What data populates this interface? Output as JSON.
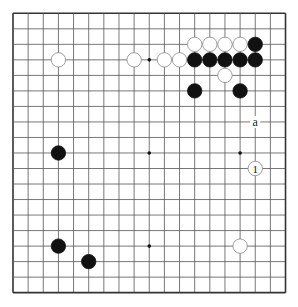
{
  "diagram": {
    "type": "go-board",
    "size": 19,
    "geometry": {
      "left": 13,
      "top": 13.3,
      "dx": 15.14,
      "dy": 15.52,
      "stone_radius": 7.2
    },
    "colors": {
      "line": "#555555",
      "border": "#333333",
      "black_stone": "#111111",
      "white_stone_fill": "#ffffff",
      "white_stone_stroke": "#888888",
      "hoshi": "#111111"
    },
    "hoshi": [
      {
        "col": 3,
        "row": 3
      },
      {
        "col": 9,
        "row": 3
      },
      {
        "col": 15,
        "row": 3
      },
      {
        "col": 3,
        "row": 9
      },
      {
        "col": 9,
        "row": 9
      },
      {
        "col": 15,
        "row": 9
      },
      {
        "col": 3,
        "row": 15
      },
      {
        "col": 9,
        "row": 15
      },
      {
        "col": 15,
        "row": 15
      }
    ],
    "stones": [
      {
        "color": "white",
        "col": 12,
        "row": 2
      },
      {
        "color": "white",
        "col": 13,
        "row": 2
      },
      {
        "color": "white",
        "col": 14,
        "row": 2
      },
      {
        "color": "white",
        "col": 15,
        "row": 2
      },
      {
        "color": "black",
        "col": 16,
        "row": 2
      },
      {
        "color": "white",
        "col": 3,
        "row": 3
      },
      {
        "color": "white",
        "col": 8,
        "row": 3
      },
      {
        "color": "white",
        "col": 10,
        "row": 3
      },
      {
        "color": "white",
        "col": 11,
        "row": 3
      },
      {
        "color": "black",
        "col": 12,
        "row": 3
      },
      {
        "color": "black",
        "col": 13,
        "row": 3
      },
      {
        "color": "black",
        "col": 14,
        "row": 3
      },
      {
        "color": "black",
        "col": 15,
        "row": 3
      },
      {
        "color": "black",
        "col": 16,
        "row": 3
      },
      {
        "color": "white",
        "col": 14,
        "row": 4
      },
      {
        "color": "black",
        "col": 12,
        "row": 5
      },
      {
        "color": "black",
        "col": 15,
        "row": 5
      },
      {
        "color": "black",
        "col": 3,
        "row": 9
      },
      {
        "color": "white",
        "col": 16,
        "row": 10,
        "label": "1"
      },
      {
        "color": "black",
        "col": 3,
        "row": 15
      },
      {
        "color": "white",
        "col": 15,
        "row": 15
      },
      {
        "color": "black",
        "col": 5,
        "row": 16
      }
    ],
    "marks": [
      {
        "text": "a",
        "col": 16,
        "row": 7
      }
    ]
  }
}
